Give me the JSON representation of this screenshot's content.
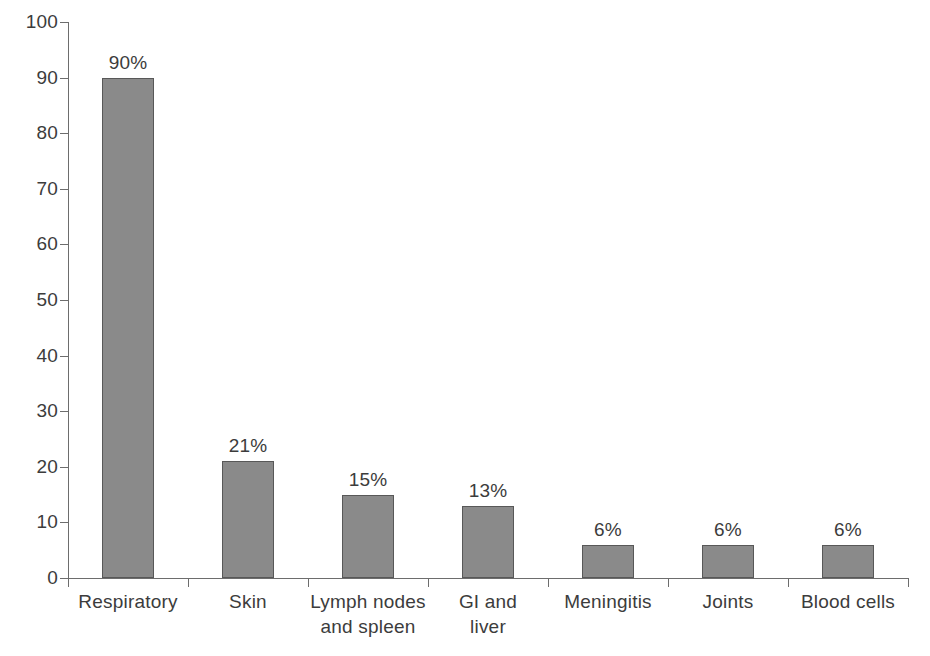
{
  "chart_data": {
    "type": "bar",
    "title": "",
    "subtitle": "",
    "xlabel": "",
    "ylabel": "",
    "ylim": [
      0,
      100
    ],
    "ytick_step": 10,
    "grid": false,
    "legend": null,
    "orientation": "vertical",
    "bar_color": "#8a8a8a",
    "bar_border_color": "#585858",
    "axis_color": "#6d6d6d",
    "text_color": "#3c3c3c",
    "categories": [
      "Respiratory",
      "Skin",
      "Lymph nodes and spleen",
      "GI and liver",
      "Meningitis",
      "Joints",
      "Blood cells"
    ],
    "category_label_lines": [
      [
        "Respiratory"
      ],
      [
        "Skin"
      ],
      [
        "Lymph nodes",
        "and spleen"
      ],
      [
        "GI and",
        "liver"
      ],
      [
        "Meningitis"
      ],
      [
        "Joints"
      ],
      [
        "Blood cells"
      ]
    ],
    "values": [
      90,
      21,
      15,
      13,
      6,
      6,
      6
    ],
    "data_labels": [
      "90%",
      "21%",
      "15%",
      "13%",
      "6%",
      "6%",
      "6%"
    ],
    "ytick_labels": [
      "0",
      "10",
      "20",
      "30",
      "40",
      "50",
      "60",
      "70",
      "80",
      "90",
      "100"
    ],
    "ytick_values": [
      0,
      10,
      20,
      30,
      40,
      50,
      60,
      70,
      80,
      90,
      100
    ]
  }
}
